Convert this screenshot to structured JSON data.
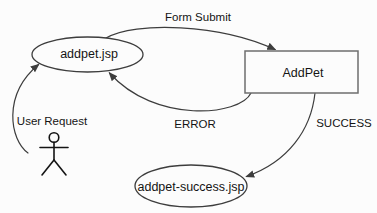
{
  "diagram": {
    "background_color": "#fcfcfc",
    "stroke_color": "#3d3d3d",
    "text_color": "#141414",
    "nodes": {
      "addpet_page": {
        "label": "addpet.jsp",
        "shape": "ellipse"
      },
      "addpet_action": {
        "label": "AddPet",
        "shape": "rectangle"
      },
      "success_page": {
        "label": "addpet-success.jsp",
        "shape": "ellipse"
      },
      "user_actor": {
        "shape": "stick-figure",
        "icon": "person-icon"
      }
    },
    "edges": {
      "form_submit": {
        "label": "Form Submit",
        "from": "addpet.jsp",
        "to": "AddPet"
      },
      "error": {
        "label": "ERROR",
        "from": "AddPet",
        "to": "addpet.jsp"
      },
      "success": {
        "label": "SUCCESS",
        "from": "AddPet",
        "to": "addpet-success.jsp"
      },
      "user_request": {
        "label": "User Request",
        "from": "user-actor",
        "to": "addpet.jsp"
      }
    }
  }
}
